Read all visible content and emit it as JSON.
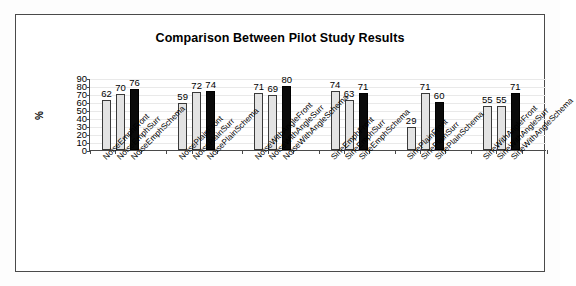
{
  "chart_data": {
    "type": "bar",
    "title": "Comparison Between Pilot Study Results",
    "xlabel": "",
    "ylabel": "%",
    "ylim": [
      0,
      90
    ],
    "yticks": [
      0,
      10,
      20,
      30,
      40,
      50,
      60,
      70,
      80,
      90
    ],
    "grid": true,
    "legend": "none",
    "categories": [
      "NoiseEmphFront",
      "NoiseEmphSurr",
      "NoiseEmphSchema",
      "NoisePlainFront",
      "NoisePlainSurr",
      "NoisePlainSchema",
      "NoiseWithAngleFront",
      "NoiseWithAngleSurr",
      "NoiseWithAngleSchema",
      "SineEmphFront",
      "SineEmphSurr",
      "SineEmphSchema",
      "SinePlainFront",
      "SinePlainSurr",
      "SinePlainSchema",
      "SineWithAngleFront",
      "SineWithAngleSurr",
      "SineWithAngleSchema"
    ],
    "values": [
      62,
      70,
      76,
      59,
      72,
      74,
      71,
      69,
      80,
      74,
      63,
      71,
      29,
      71,
      60,
      55,
      55,
      71
    ],
    "bar_colors": [
      "light",
      "light",
      "dark",
      "light",
      "light",
      "dark",
      "light",
      "light",
      "dark",
      "light",
      "light",
      "dark",
      "light",
      "light",
      "dark",
      "light",
      "light",
      "dark"
    ],
    "colors": {
      "light_bar": "#e3e3e3",
      "dark_bar": "#0a0a0a",
      "axis": "#4a4a4a",
      "grid": "#e9e9e9",
      "text": "#000000",
      "frame": "#4a4a4a",
      "background": "#ffffff"
    }
  }
}
